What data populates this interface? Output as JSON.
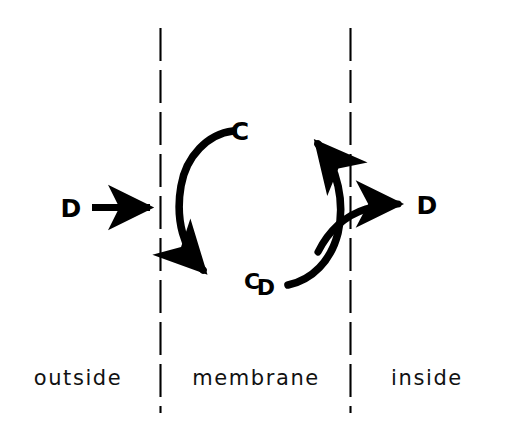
{
  "figure": {
    "background_color": "#ffffff",
    "stroke_color": "#000000",
    "width": 513,
    "height": 431
  },
  "regions": [
    {
      "id": "outside",
      "label": "outside"
    },
    {
      "id": "membrane",
      "label": "membrane"
    },
    {
      "id": "inside",
      "label": "inside"
    }
  ],
  "boundaries": [
    {
      "id": "outer-membrane-boundary",
      "style": "dashed"
    },
    {
      "id": "inner-membrane-boundary",
      "style": "dashed"
    }
  ],
  "species": {
    "carrier_top": "C",
    "complex_bottom": "CD",
    "complex_bottom_first": "C",
    "complex_bottom_second": "D",
    "substrate_outside": "D",
    "substrate_inside": "D"
  },
  "arrows": [
    {
      "id": "substrate-uptake-arrow",
      "from": "D (outside)",
      "to": "membrane boundary",
      "shape": "straight",
      "direction": "right"
    },
    {
      "id": "carrier-loading-arrow",
      "from": "C",
      "to": "CD",
      "shape": "arc",
      "direction": "counter-clockwise-left-side"
    },
    {
      "id": "carrier-return-arrow",
      "from": "CD",
      "to": "C",
      "shape": "arc",
      "direction": "counter-clockwise-right-side"
    },
    {
      "id": "substrate-release-arrow",
      "from": "carrier cycle",
      "to": "D (inside)",
      "shape": "curve",
      "direction": "right"
    }
  ]
}
